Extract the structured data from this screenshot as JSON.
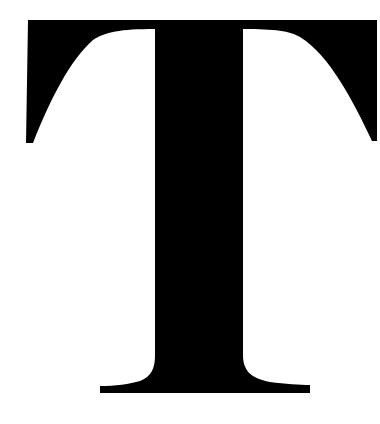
{
  "image": {
    "letter": "T",
    "description": "Large black serif capital letter T on white background",
    "colors": {
      "glyph": "#000000",
      "background": "#ffffff"
    }
  }
}
